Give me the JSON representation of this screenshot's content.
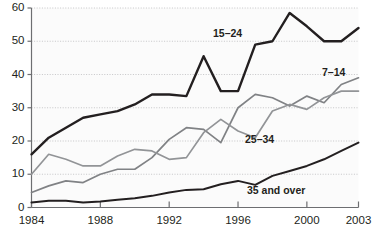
{
  "chart_data": {
    "type": "line",
    "title": "",
    "subtitle": "",
    "xlabel": "",
    "ylabel": "",
    "xlim": [
      1984,
      2003
    ],
    "ylim": [
      0,
      60
    ],
    "ytick_values": [
      0,
      10,
      20,
      30,
      40,
      50,
      60
    ],
    "ytick_labels": [
      "0",
      "10",
      "20",
      "30",
      "40",
      "50",
      "60"
    ],
    "xtick_values": [
      1984,
      1988,
      1992,
      1996,
      2000,
      2003
    ],
    "xtick_labels": [
      "1984",
      "1988",
      "1992",
      "1996",
      "2000",
      "2003"
    ],
    "grid": "horizontal dotted gridlines",
    "legend": "inline series labels on plot",
    "x": [
      1984,
      1985,
      1986,
      1987,
      1988,
      1989,
      1990,
      1991,
      1992,
      1993,
      1994,
      1995,
      1996,
      1997,
      1998,
      1999,
      2000,
      2001,
      2002,
      2003
    ],
    "series": [
      {
        "name": "15–24",
        "color": "#231f20",
        "width": 2.4,
        "label": "15–24",
        "label_x": 213,
        "label_y": 27,
        "values": [
          16,
          21,
          24,
          27,
          28,
          29,
          31,
          34,
          34,
          33.5,
          45.5,
          35,
          35,
          49,
          50,
          58.5,
          54.5,
          50,
          50,
          54
        ]
      },
      {
        "name": "7–14",
        "color": "#808285",
        "width": 1.7,
        "label": "7–14",
        "label_x": 322,
        "label_y": 66,
        "values": [
          4.5,
          6.5,
          8,
          7.5,
          10,
          11.5,
          11.5,
          15,
          20.5,
          24,
          23.5,
          19.5,
          30,
          34,
          33,
          30.5,
          33.5,
          31.5,
          37,
          39
        ]
      },
      {
        "name": "25–34",
        "color": "#929497",
        "width": 1.7,
        "label": "25–34",
        "label_x": 245,
        "label_y": 133,
        "values": [
          10,
          16,
          14.5,
          12.5,
          12.5,
          15.5,
          17.5,
          17,
          14.5,
          15,
          22.5,
          26.5,
          23,
          21,
          29,
          31,
          29.5,
          33,
          35,
          35
        ]
      },
      {
        "name": "35 and over",
        "color": "#231f20",
        "width": 2.0,
        "label": "35 and over",
        "label_x": 247,
        "label_y": 184,
        "values": [
          1.5,
          2,
          2,
          1.5,
          1.8,
          2.3,
          2.8,
          3.5,
          4.5,
          5.3,
          5.5,
          7,
          8,
          6.8,
          9.5,
          11,
          12.5,
          14.5,
          17,
          19.5
        ]
      }
    ]
  }
}
